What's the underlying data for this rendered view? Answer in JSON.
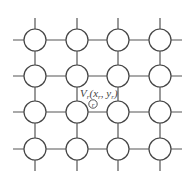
{
  "diagram": {
    "type": "grid-network",
    "rows": 4,
    "cols": 4,
    "xs": [
      35,
      77,
      118,
      160
    ],
    "ys": [
      40,
      76,
      112,
      149
    ],
    "node_radius": 11,
    "stub_length": 22,
    "label": {
      "main": "V",
      "main_sub": "r",
      "args_open": "(x",
      "args_sub1": "r",
      "args_mid": ", y",
      "args_sub2": "r",
      "args_close": ")",
      "marker": "r"
    },
    "colors": {
      "line": "#555555",
      "node_stroke": "#444444",
      "text": "#444444"
    }
  }
}
